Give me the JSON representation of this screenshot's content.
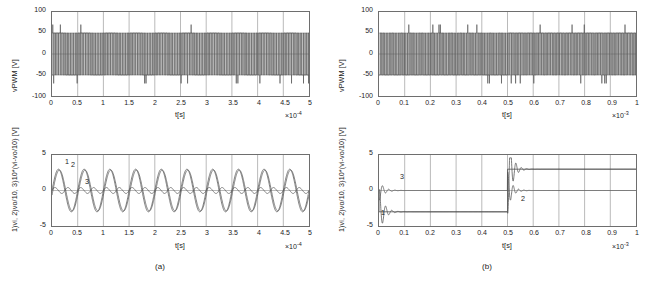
{
  "figure": {
    "background": "#ffffff",
    "line_color": "#555555",
    "axis_color": "#6e6e6e",
    "grid_color": "#9a9a9a",
    "captions": [
      {
        "id": "caption-a",
        "text": "(a)"
      },
      {
        "id": "caption-b",
        "text": "(b)"
      }
    ]
  },
  "chart_data": [
    {
      "id": "panel-a-top",
      "type": "line",
      "title": "",
      "xlabel": "t[s]",
      "ylabel": "vPWM [V]",
      "x_exponent": "×10",
      "x_exponent_power": "-4",
      "xlim": [
        0,
        5
      ],
      "ylim": [
        -100,
        100
      ],
      "xticks": [
        "0",
        "0.5",
        "1",
        "1.5",
        "2",
        "2.5",
        "3",
        "3.5",
        "4",
        "4.5",
        "5"
      ],
      "yticks": [
        "100",
        "50",
        "0",
        "-50",
        "-100"
      ],
      "grid": true,
      "legend": "none",
      "description": "PWM switched voltage alternating between +50 V and -50 V at high frequency over 0 to 5e-4 s; dense vertical switching edges spanning the full band, with occasional spikes to about +70 V and -70 V.",
      "series": [
        {
          "name": "vPWM",
          "waveform": "pwm",
          "amplitude": 50,
          "spike": 70
        }
      ]
    },
    {
      "id": "panel-a-bottom",
      "type": "line",
      "title": "",
      "xlabel": "t[s]",
      "ylabel": "1)vi, 2)vo/10, 3)10*(vi-vo/10) [V]",
      "x_exponent": "×10",
      "x_exponent_power": "-4",
      "xlim": [
        0,
        5
      ],
      "ylim": [
        -5,
        5
      ],
      "xticks": [
        "0",
        "0.5",
        "1",
        "1.5",
        "2",
        "2.5",
        "3",
        "3.5",
        "4",
        "4.5",
        "5"
      ],
      "yticks": [
        "5",
        "0",
        "-5"
      ],
      "grid": true,
      "legend": "inline-curve-numbers",
      "annotations": [
        {
          "label": "1",
          "x": 0.28,
          "y": 3.7
        },
        {
          "label": "2",
          "x": 0.52,
          "y": 3.25
        },
        {
          "label": "3",
          "x": 1.1,
          "y": 1.35
        }
      ],
      "description": "Steady-state sinusoidal operation: traces 1 and 2 are near-overlapping sine waves of amplitude about 3 V and period 1e-4 s (10 cycles shown); trace 3 is a small-amplitude error ripple about 0.45 V around zero at twice the frequency.",
      "series": [
        {
          "name": "1) vi",
          "waveform": "sine",
          "amplitude": 3.0,
          "cycles": 10,
          "phase_deg": 0
        },
        {
          "name": "2) vo/10",
          "waveform": "sine",
          "amplitude": 2.9,
          "cycles": 10,
          "phase_deg": -14
        },
        {
          "name": "3) 10*(vi-vo/10)",
          "waveform": "ripple",
          "amplitude": 0.45,
          "cycles": 20,
          "phase_deg": 0
        }
      ]
    },
    {
      "id": "panel-b-top",
      "type": "line",
      "title": "",
      "xlabel": "t[s]",
      "ylabel": "vPWM [V]",
      "x_exponent": "×10",
      "x_exponent_power": "-3",
      "xlim": [
        0,
        1
      ],
      "ylim": [
        -100,
        100
      ],
      "xticks": [
        "0",
        "0.1",
        "0.2",
        "0.3",
        "0.4",
        "0.5",
        "0.6",
        "0.7",
        "0.8",
        "0.9",
        "1"
      ],
      "yticks": [
        "100",
        "50",
        "0",
        "-50",
        "-100"
      ],
      "grid": true,
      "legend": "none",
      "description": "PWM voltage switching between +50 V and -50 V. Before t = 0.5e-3 s the duty pattern is dense and skewed low; after the step at 0.5e-3 s the pattern changes to a different dense switching band, still bounded by +/-50 V with spikes near +/-70 V.",
      "series": [
        {
          "name": "vPWM",
          "waveform": "pwm-step",
          "amplitude": 50,
          "spike": 70,
          "step_at": 0.5
        }
      ]
    },
    {
      "id": "panel-b-bottom",
      "type": "line",
      "title": "",
      "xlabel": "t[s]",
      "ylabel": "1)vi, 2)vo/10, 3)10*(vi-vo/10) [V]",
      "x_exponent": "×10",
      "x_exponent_power": "-3",
      "xlim": [
        0,
        1
      ],
      "ylim": [
        -5,
        5
      ],
      "xticks": [
        "0",
        "0.1",
        "0.2",
        "0.3",
        "0.4",
        "0.5",
        "0.6",
        "0.7",
        "0.8",
        "0.9",
        "1"
      ],
      "yticks": [
        "5",
        "0",
        "-5"
      ],
      "grid": true,
      "legend": "inline-curve-numbers",
      "annotations": [
        {
          "label": "3",
          "x": 0.055,
          "y": 1.15
        },
        {
          "label": "1",
          "x": 0.012,
          "y": -3.6
        },
        {
          "label": "2",
          "x": 0.565,
          "y": -1.0
        }
      ],
      "description": "Step response: trace 1 (vi) steps from 0 down to -3 V at t=0 and up to +3 V at t=0.5e-3 s. Trace 2 (vo/10) follows with a fast transient and small overshoot then settles on the new level. Trace 3 is the scaled error, a sharp spike at each transition that decays to zero.",
      "series": [
        {
          "name": "1) vi",
          "waveform": "step",
          "levels": [
            0,
            -3,
            3
          ],
          "step_times": [
            0,
            0.5
          ]
        },
        {
          "name": "2) vo/10",
          "waveform": "step-response",
          "levels": [
            0,
            -3,
            3
          ],
          "step_times": [
            0,
            0.5
          ],
          "overshoot": 0.35
        },
        {
          "name": "3) 10*(vi-vo/10)",
          "waveform": "error-spike",
          "peak": 1.2,
          "step_times": [
            0,
            0.5
          ]
        }
      ]
    }
  ]
}
